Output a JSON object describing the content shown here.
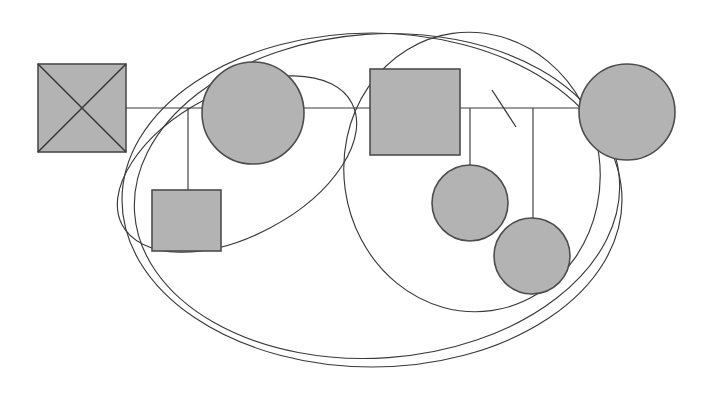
{
  "figure": {
    "title": "Abstract geometric line diagram",
    "canvas": {
      "width": 707,
      "height": 395,
      "background": "#ffffff"
    },
    "palette": {
      "shape_fill": "#b3b3b3",
      "shape_stroke": "#4d4d4d",
      "curve_stroke": "#3a3a3a",
      "connector_stroke": "#3a3a3a",
      "background": "#ffffff"
    }
  },
  "shapes": {
    "crossed_square": {
      "name": "crossed-square",
      "label": "Crossed square",
      "x": 38,
      "y": 64,
      "width": 88,
      "height": 88,
      "fill": "#b3b3b3",
      "stroke": "#4d4d4d",
      "has_diagonals": true
    },
    "circles": [
      {
        "name": "circle-left-upper",
        "label": "Left upper circle",
        "cx": 253,
        "cy": 113,
        "r": 51,
        "fill": "#b3b3b3",
        "stroke": "#4d4d4d"
      },
      {
        "name": "circle-right-upper",
        "label": "Right upper circle",
        "cx": 627,
        "cy": 112,
        "r": 48,
        "fill": "#b3b3b3",
        "stroke": "#4d4d4d"
      },
      {
        "name": "circle-lower-inner",
        "label": "Lower inner circle",
        "cx": 470,
        "cy": 203,
        "r": 38,
        "fill": "#b3b3b3",
        "stroke": "#4d4d4d"
      },
      {
        "name": "circle-lower-outer",
        "label": "Lower outer circle",
        "cx": 532,
        "cy": 256,
        "r": 38,
        "fill": "#b3b3b3",
        "stroke": "#4d4d4d"
      }
    ],
    "rectangles": [
      {
        "name": "square-lower-left",
        "label": "Lower left square",
        "x": 152,
        "y": 190,
        "width": 69,
        "height": 61,
        "fill": "#b3b3b3",
        "stroke": "#4d4d4d"
      },
      {
        "name": "rectangle-center",
        "label": "Center rectangle",
        "x": 370,
        "y": 69,
        "width": 90,
        "height": 86,
        "fill": "#b3b3b3",
        "stroke": "#4d4d4d"
      }
    ]
  },
  "connectors": {
    "horizontal_axis": {
      "name": "horizontal-axis-line",
      "label": "Horizontal spine",
      "y": 108,
      "x1": 126,
      "x2": 627
    },
    "drops": [
      {
        "name": "drop-line-left",
        "label": "Drop to lower left square",
        "x": 188,
        "y1": 108,
        "y2": 190
      },
      {
        "name": "drop-line-mid",
        "label": "Drop to lower inner circle",
        "x": 470,
        "y1": 108,
        "y2": 167
      },
      {
        "name": "drop-line-right",
        "label": "Drop to lower outer circle",
        "x": 533,
        "y1": 108,
        "y2": 220
      }
    ],
    "tick": {
      "name": "diagonal-tick-mark",
      "label": "Diagonal slash mark",
      "x1": 492,
      "y1": 90,
      "x2": 516,
      "y2": 127
    }
  },
  "curves": [
    {
      "name": "ellipse-outer-large",
      "label": "Outer large ellipse",
      "cx": 372,
      "cy": 200,
      "rx": 250,
      "ry": 167,
      "rotation": 0
    },
    {
      "name": "ellipse-right-large",
      "label": "Right large ellipse",
      "cx": 472,
      "cy": 172,
      "rx": 128,
      "ry": 140,
      "rotation": -8
    },
    {
      "name": "ellipse-left-tilted",
      "label": "Left tilted ellipse",
      "cx": 237,
      "cy": 164,
      "rx": 130,
      "ry": 72,
      "rotation": -28
    },
    {
      "name": "ellipse-outer-secondary",
      "label": "Secondary outer sweep",
      "cx": 377,
      "cy": 196,
      "rx": 243,
      "ry": 162,
      "rotation": -4
    }
  ]
}
